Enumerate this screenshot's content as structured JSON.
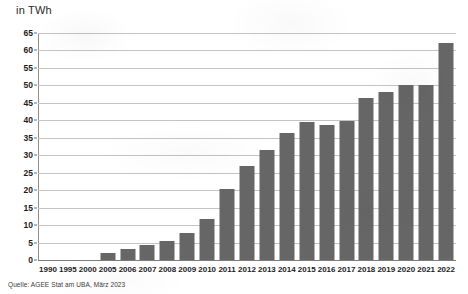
{
  "unit_label": "in TWh",
  "source_note": "Quelle: AGEE Stat am UBA, März 2023",
  "colors": {
    "bar": "#666666",
    "gridline": "#c4c4c4",
    "axis": "#7d7d7d",
    "text": "#1c1c1c",
    "background": "#ffffff"
  },
  "chart_data": {
    "type": "bar",
    "title": "",
    "subtitle": "",
    "xlabel": "",
    "ylabel": "in TWh",
    "ylim": [
      0,
      65
    ],
    "ytick_step": 5,
    "yticks": [
      65,
      60,
      55,
      50,
      45,
      40,
      35,
      30,
      25,
      20,
      15,
      10,
      5,
      0
    ],
    "ytick_labels": [
      "65",
      "60",
      "55",
      "50",
      "45",
      "40",
      "35",
      "30",
      "25",
      "20",
      "15",
      "10",
      "5",
      "0"
    ],
    "grid": true,
    "legend": "none",
    "categories": [
      "1990",
      "1995",
      "2000",
      "2005",
      "2006",
      "2007",
      "2008",
      "2009",
      "2010",
      "2011",
      "2012",
      "2013",
      "2014",
      "2015",
      "2016",
      "2017",
      "2018",
      "2019",
      "2020",
      "2021",
      "2022"
    ],
    "values": [
      0,
      0,
      0,
      1.9,
      3.1,
      4.2,
      5.4,
      7.8,
      11.7,
      20.2,
      26.8,
      31.5,
      36.5,
      39.5,
      38.7,
      39.8,
      46.5,
      48.2,
      50.2,
      50.2,
      62.0
    ],
    "bar_color": "#666666"
  }
}
